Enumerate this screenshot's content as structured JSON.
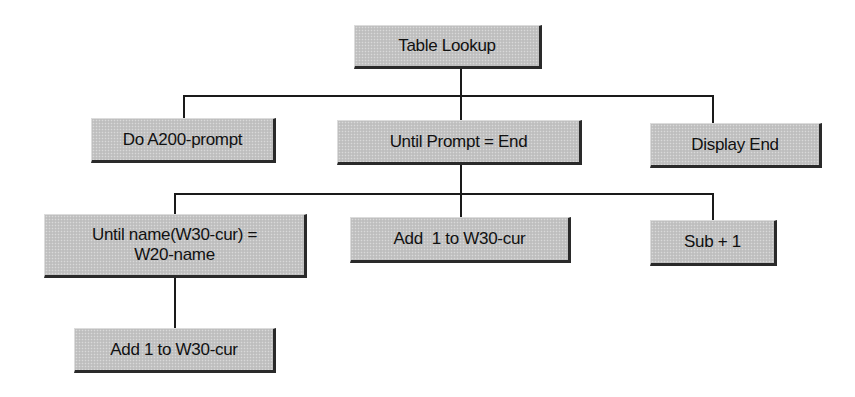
{
  "diagram": {
    "type": "structure-chart",
    "colors": {
      "box_fill": "#c4c4c4",
      "box_shadow": "#2a2a2a",
      "line": "#1a1a1a",
      "background": "#ffffff"
    },
    "root": {
      "label": "Table Lookup"
    },
    "level1": [
      {
        "label": "Do A200-prompt"
      },
      {
        "label": "Until Prompt = End"
      },
      {
        "label": "Display End"
      }
    ],
    "level2": [
      {
        "label_line1": "Until name(W30-cur) =",
        "label_line2": "W20-name"
      },
      {
        "label": "Add  1 to W30-cur"
      },
      {
        "label": "Sub + 1"
      }
    ],
    "level3": [
      {
        "label": "Add 1 to W30-cur"
      }
    ],
    "edges": [
      [
        "Table Lookup",
        "Do A200-prompt"
      ],
      [
        "Table Lookup",
        "Until Prompt = End"
      ],
      [
        "Table Lookup",
        "Display End"
      ],
      [
        "Until Prompt = End",
        "Until name(W30-cur) = W20-name"
      ],
      [
        "Until Prompt = End",
        "Add  1 to W30-cur"
      ],
      [
        "Until Prompt = End",
        "Sub + 1"
      ],
      [
        "Until name(W30-cur) = W20-name",
        "Add 1 to W30-cur"
      ]
    ]
  }
}
